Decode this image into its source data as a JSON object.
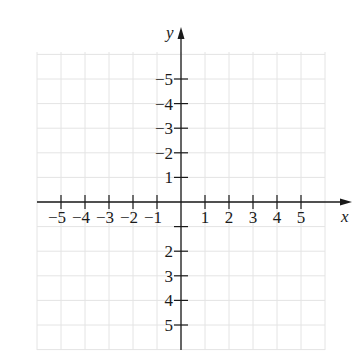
{
  "chart_data": {
    "type": "scatter",
    "title": "",
    "xlabel": "x",
    "ylabel": "y",
    "xlim": [
      -6,
      6
    ],
    "ylim": [
      -6,
      6
    ],
    "grid": true,
    "x_ticks": [
      -5,
      -4,
      -3,
      -2,
      -1,
      1,
      2,
      3,
      4,
      5
    ],
    "y_ticks": [
      -5,
      -4,
      -3,
      -2,
      1,
      2,
      3,
      4,
      5
    ],
    "x_tick_labels": [
      "−5",
      "−4",
      "−3",
      "−2",
      "−1",
      "1",
      "2",
      "3",
      "4",
      "5"
    ],
    "y_tick_labels": [
      "5",
      "4",
      "3",
      "2",
      "1",
      "−2",
      "−3",
      "−4",
      "−5"
    ],
    "points": [],
    "legend": null
  },
  "colors": {
    "axis": "#1a1a1a",
    "grid": "#e4e4e4",
    "background": "#ffffff"
  }
}
